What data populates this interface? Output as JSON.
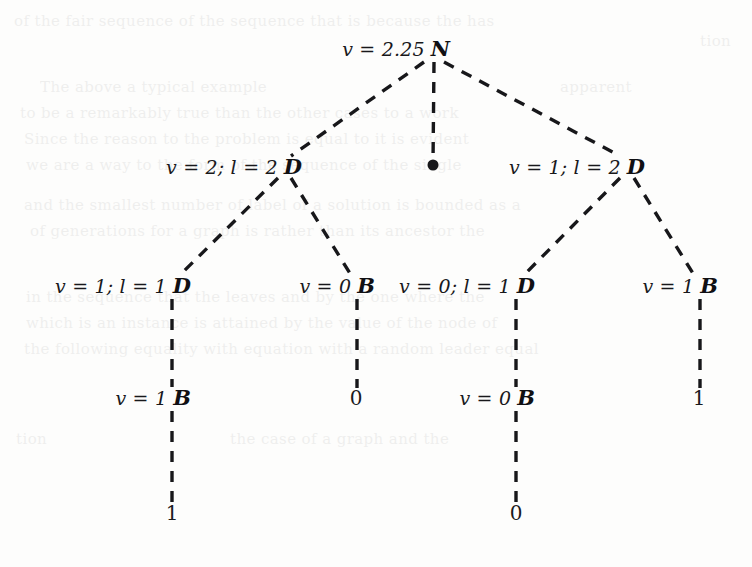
{
  "figure": {
    "width": 752,
    "height": 567,
    "background_color": "#fdfdfc",
    "ink_color": "#17171a",
    "edge_style": "dashed",
    "edge_width": 3.4,
    "edge_dash": "11 9"
  },
  "tree": {
    "nodes": [
      {
        "id": "root",
        "value_label": "v = 2.25",
        "letter": "N",
        "x": 432,
        "y": 48,
        "label_x": 424,
        "label_y": 48
      },
      {
        "id": "d-left",
        "value_label": "v = 2; l = 2",
        "letter": "D",
        "x": 283,
        "y": 166,
        "label_x": 276,
        "label_y": 166
      },
      {
        "id": "d-right",
        "value_label": "v = 1; l = 2",
        "letter": "D",
        "x": 626,
        "y": 166,
        "label_x": 619,
        "label_y": 166
      },
      {
        "id": "d-left-left",
        "value_label": "v = 1; l = 1",
        "letter": "D",
        "x": 172,
        "y": 285,
        "label_x": 165,
        "label_y": 285
      },
      {
        "id": "b-left-right",
        "value_label": "v = 0",
        "letter": "B",
        "x": 356,
        "y": 285,
        "label_x": 349,
        "label_y": 285
      },
      {
        "id": "d-right-left",
        "value_label": "v = 0; l = 1",
        "letter": "D",
        "x": 516,
        "y": 285,
        "label_x": 509,
        "label_y": 285
      },
      {
        "id": "b-right-right",
        "value_label": "v = 1",
        "letter": "B",
        "x": 699,
        "y": 285,
        "label_x": 692,
        "label_y": 285
      },
      {
        "id": "b-deep-left",
        "value_label": "v = 1",
        "letter": "B",
        "x": 172,
        "y": 397,
        "label_x": 165,
        "label_y": 397
      },
      {
        "id": "b-deep-right",
        "value_label": "v = 0",
        "letter": "B",
        "x": 516,
        "y": 397,
        "label_x": 509,
        "label_y": 397
      }
    ],
    "leaves": [
      {
        "id": "leaf-root-dot",
        "text": "",
        "shape": "dot",
        "x": 432,
        "y": 165
      },
      {
        "id": "leaf-left-right",
        "text": "0",
        "shape": "text",
        "x": 356,
        "y": 398
      },
      {
        "id": "leaf-right-right",
        "text": "1",
        "shape": "text",
        "x": 699,
        "y": 398
      },
      {
        "id": "leaf-deep-left",
        "text": "1",
        "shape": "text",
        "x": 172,
        "y": 513
      },
      {
        "id": "leaf-deep-right",
        "text": "0",
        "shape": "text",
        "x": 516,
        "y": 513
      }
    ],
    "edges": [
      {
        "id": "edge-root-to-d-left",
        "from": "root",
        "to": "d-left",
        "x1": 424,
        "y1": 62,
        "x2": 291,
        "y2": 156
      },
      {
        "id": "edge-root-to-dot",
        "from": "root",
        "to": "leaf-root-dot",
        "x1": 434,
        "y1": 62,
        "x2": 433,
        "y2": 163
      },
      {
        "id": "edge-root-to-d-right",
        "from": "root",
        "to": "d-right",
        "x1": 444,
        "y1": 62,
        "x2": 620,
        "y2": 156
      },
      {
        "id": "edge-d-left-to-d-left-left",
        "from": "d-left",
        "to": "d-left-left",
        "x1": 278,
        "y1": 178,
        "x2": 180,
        "y2": 275
      },
      {
        "id": "edge-d-left-to-b-left-right",
        "from": "d-left",
        "to": "b-left-right",
        "x1": 291,
        "y1": 178,
        "x2": 351,
        "y2": 275
      },
      {
        "id": "edge-d-right-to-d-right-left",
        "from": "d-right",
        "to": "d-right-left",
        "x1": 620,
        "y1": 178,
        "x2": 524,
        "y2": 275
      },
      {
        "id": "edge-d-right-to-b-right-right",
        "from": "d-right",
        "to": "b-right-right",
        "x1": 634,
        "y1": 178,
        "x2": 694,
        "y2": 275
      },
      {
        "id": "edge-d-left-left-to-b-deep-left",
        "from": "d-left-left",
        "to": "b-deep-left",
        "x1": 172,
        "y1": 299,
        "x2": 172,
        "y2": 387
      },
      {
        "id": "edge-b-left-right-to-leaf",
        "from": "b-left-right",
        "to": "leaf-left-right",
        "x1": 357,
        "y1": 299,
        "x2": 357,
        "y2": 388
      },
      {
        "id": "edge-d-right-left-to-b-deep-right",
        "from": "d-right-left",
        "to": "b-deep-right",
        "x1": 516,
        "y1": 299,
        "x2": 516,
        "y2": 387
      },
      {
        "id": "edge-b-right-right-to-leaf",
        "from": "b-right-right",
        "to": "leaf-right-right",
        "x1": 700,
        "y1": 299,
        "x2": 700,
        "y2": 388
      },
      {
        "id": "edge-b-deep-left-to-leaf",
        "from": "b-deep-left",
        "to": "leaf-deep-left",
        "x1": 172,
        "y1": 411,
        "x2": 172,
        "y2": 503
      },
      {
        "id": "edge-b-deep-right-to-leaf",
        "from": "b-deep-right",
        "to": "leaf-deep-right",
        "x1": 516,
        "y1": 411,
        "x2": 516,
        "y2": 503
      }
    ]
  },
  "bleed_through": [
    {
      "text": "of the fair sequence of the sequence that is because the has",
      "x": 14,
      "y": 12
    },
    {
      "text": "tion",
      "x": 700,
      "y": 32
    },
    {
      "text": "The above a typical example",
      "x": 40,
      "y": 78
    },
    {
      "text": "apparent",
      "x": 560,
      "y": 78
    },
    {
      "text": "to be a remarkably true than the other cases to a work",
      "x": 20,
      "y": 104
    },
    {
      "text": "Since the reason to the problem is equal to it is evident",
      "x": 24,
      "y": 130
    },
    {
      "text": "we are a way to the form of the sequence of the single",
      "x": 26,
      "y": 156
    },
    {
      "text": "and the smallest number of label of a solution is bounded as a",
      "x": 24,
      "y": 196
    },
    {
      "text": "of generations for a graph is rather than its ancestor the",
      "x": 30,
      "y": 222
    },
    {
      "text": "in the sequence that the leaves and by the one where the",
      "x": 26,
      "y": 288
    },
    {
      "text": "which is an instance is attained by the value of the node of",
      "x": 26,
      "y": 314
    },
    {
      "text": "the following equality with equation with a random leader equal",
      "x": 24,
      "y": 340
    },
    {
      "text": "tion",
      "x": 16,
      "y": 430
    },
    {
      "text": "the case of a graph and the",
      "x": 230,
      "y": 430
    }
  ]
}
